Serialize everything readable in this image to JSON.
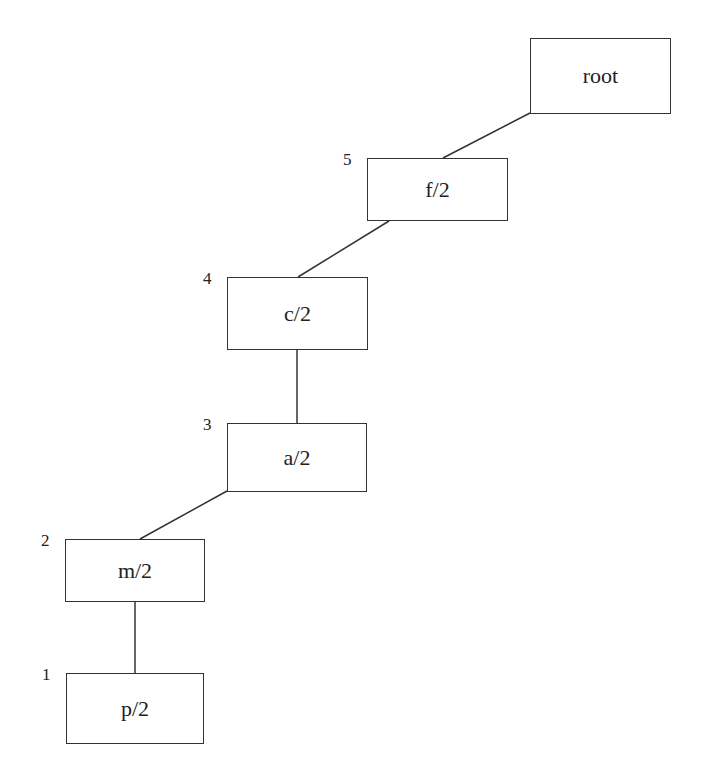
{
  "diagram": {
    "type": "tree-chain",
    "nodes": [
      {
        "id": "root",
        "label": "root",
        "index": "",
        "x": 530,
        "y": 38,
        "w": 141,
        "h": 76
      },
      {
        "id": "f",
        "label": "f/2",
        "index": "5",
        "x": 367,
        "y": 158,
        "w": 141,
        "h": 63
      },
      {
        "id": "c",
        "label": "c/2",
        "index": "4",
        "x": 227,
        "y": 277,
        "w": 141,
        "h": 73
      },
      {
        "id": "a",
        "label": "a/2",
        "index": "3",
        "x": 227,
        "y": 423,
        "w": 140,
        "h": 69
      },
      {
        "id": "m",
        "label": "m/2",
        "index": "2",
        "x": 65,
        "y": 539,
        "w": 140,
        "h": 63
      },
      {
        "id": "p",
        "label": "p/2",
        "index": "1",
        "x": 66,
        "y": 673,
        "w": 138,
        "h": 71
      }
    ],
    "edges": [
      {
        "from": "root",
        "to": "f",
        "x1": 530,
        "y1": 113,
        "x2": 443,
        "y2": 158
      },
      {
        "from": "f",
        "to": "c",
        "x1": 389,
        "y1": 221,
        "x2": 298,
        "y2": 277
      },
      {
        "from": "c",
        "to": "a",
        "x1": 297,
        "y1": 349,
        "x2": 297,
        "y2": 423
      },
      {
        "from": "a",
        "to": "m",
        "x1": 227,
        "y1": 491,
        "x2": 140,
        "y2": 539
      },
      {
        "from": "m",
        "to": "p",
        "x1": 135,
        "y1": 601,
        "x2": 135,
        "y2": 673
      }
    ],
    "colors": {
      "stroke": "#333333",
      "text": "#222222",
      "background": "#ffffff"
    }
  }
}
